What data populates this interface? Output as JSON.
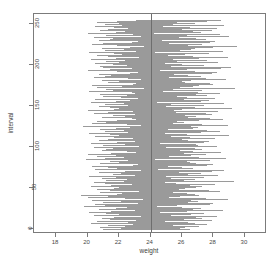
{
  "chart_data": {
    "type": "line",
    "title": "",
    "xlabel": "weight",
    "ylabel": "interval",
    "xlim": [
      16.6,
      31.4
    ],
    "ylim": [
      -6,
      262
    ],
    "grid": false,
    "legend": null,
    "xticks": [
      18,
      20,
      22,
      24,
      26,
      28,
      30
    ],
    "yticks": [
      0,
      50,
      100,
      150,
      200,
      250
    ],
    "series_description": "Horizontal confidence-interval segments, one per simulated interval index (0-255), drawn in light gray; a vertical reference line marks the true mean.",
    "reference_line": {
      "orientation": "vertical",
      "x": 24,
      "color": "#6e6e6e"
    },
    "segment_color": "#9a9a9a",
    "n_intervals": 256,
    "intervals": [
      [
        21.0,
        26.5
      ],
      [
        22.1,
        25.9
      ],
      [
        21.6,
        26.2
      ],
      [
        20.8,
        26.0
      ],
      [
        22.4,
        27.1
      ],
      [
        21.3,
        25.4
      ],
      [
        22.9,
        27.6
      ],
      [
        20.2,
        25.1
      ],
      [
        21.9,
        26.8
      ],
      [
        22.6,
        26.4
      ],
      [
        20.6,
        24.9
      ],
      [
        23.1,
        27.9
      ],
      [
        21.4,
        26.1
      ],
      [
        22.2,
        27.3
      ],
      [
        20.9,
        25.6
      ],
      [
        21.7,
        26.9
      ],
      [
        23.4,
        28.2
      ],
      [
        20.4,
        25.3
      ],
      [
        22.0,
        26.6
      ],
      [
        21.2,
        25.8
      ],
      [
        22.8,
        27.4
      ],
      [
        20.1,
        24.6
      ],
      [
        21.5,
        26.3
      ],
      [
        23.0,
        28.6
      ],
      [
        22.3,
        26.7
      ],
      [
        20.7,
        25.0
      ],
      [
        21.8,
        27.2
      ],
      [
        22.5,
        26.0
      ],
      [
        19.8,
        24.4
      ],
      [
        21.1,
        25.7
      ],
      [
        22.7,
        27.8
      ],
      [
        20.5,
        25.5
      ],
      [
        23.2,
        28.0
      ],
      [
        21.0,
        26.4
      ],
      [
        22.1,
        27.0
      ],
      [
        20.3,
        24.8
      ],
      [
        21.6,
        26.6
      ],
      [
        23.5,
        28.9
      ],
      [
        22.4,
        27.5
      ],
      [
        20.0,
        25.2
      ],
      [
        21.3,
        25.9
      ],
      [
        22.9,
        27.1
      ],
      [
        19.6,
        24.1
      ],
      [
        21.9,
        26.8
      ],
      [
        22.2,
        26.3
      ],
      [
        20.8,
        25.4
      ],
      [
        23.3,
        28.4
      ],
      [
        21.4,
        26.0
      ],
      [
        22.6,
        27.7
      ],
      [
        20.6,
        25.8
      ],
      [
        21.7,
        26.2
      ],
      [
        22.0,
        26.9
      ],
      [
        23.1,
        27.3
      ],
      [
        20.2,
        24.7
      ],
      [
        21.5,
        26.5
      ],
      [
        22.8,
        28.1
      ],
      [
        21.1,
        25.6
      ],
      [
        20.4,
        24.9
      ],
      [
        22.3,
        27.0
      ],
      [
        23.6,
        29.3
      ],
      [
        21.2,
        26.1
      ],
      [
        22.5,
        26.8
      ],
      [
        20.9,
        25.3
      ],
      [
        21.8,
        27.4
      ],
      [
        22.7,
        26.6
      ],
      [
        20.1,
        25.0
      ],
      [
        23.0,
        28.3
      ],
      [
        21.6,
        26.4
      ],
      [
        22.1,
        27.2
      ],
      [
        20.7,
        25.5
      ],
      [
        21.0,
        25.8
      ],
      [
        22.4,
        27.9
      ],
      [
        23.4,
        28.7
      ],
      [
        20.5,
        24.5
      ],
      [
        21.9,
        26.7
      ],
      [
        22.2,
        26.2
      ],
      [
        21.3,
        26.0
      ],
      [
        20.3,
        25.1
      ],
      [
        22.9,
        27.6
      ],
      [
        23.2,
        28.0
      ],
      [
        21.7,
        26.9
      ],
      [
        20.8,
        25.7
      ],
      [
        22.0,
        26.5
      ],
      [
        21.4,
        26.3
      ],
      [
        22.6,
        27.8
      ],
      [
        19.9,
        24.3
      ],
      [
        21.1,
        25.4
      ],
      [
        23.5,
        28.8
      ],
      [
        22.3,
        27.1
      ],
      [
        20.6,
        25.2
      ],
      [
        21.8,
        26.6
      ],
      [
        22.8,
        27.5
      ],
      [
        20.0,
        24.8
      ],
      [
        21.5,
        26.1
      ],
      [
        23.1,
        28.5
      ],
      [
        22.5,
        26.7
      ],
      [
        20.9,
        25.9
      ],
      [
        21.2,
        25.5
      ],
      [
        22.7,
        27.3
      ],
      [
        21.6,
        26.8
      ],
      [
        20.4,
        25.0
      ],
      [
        23.3,
        28.2
      ],
      [
        22.1,
        27.0
      ],
      [
        21.0,
        26.2
      ],
      [
        22.4,
        26.9
      ],
      [
        20.2,
        24.6
      ],
      [
        21.9,
        27.4
      ],
      [
        23.0,
        27.7
      ],
      [
        22.2,
        26.4
      ],
      [
        20.7,
        25.6
      ],
      [
        21.3,
        26.0
      ],
      [
        22.9,
        28.1
      ],
      [
        21.7,
        26.5
      ],
      [
        20.5,
        25.3
      ],
      [
        23.6,
        29.0
      ],
      [
        22.0,
        26.8
      ],
      [
        21.4,
        26.3
      ],
      [
        20.1,
        24.9
      ],
      [
        22.6,
        27.2
      ],
      [
        23.2,
        28.4
      ],
      [
        21.1,
        25.8
      ],
      [
        22.3,
        27.6
      ],
      [
        20.8,
        25.1
      ],
      [
        21.8,
        26.7
      ],
      [
        22.7,
        27.0
      ],
      [
        19.7,
        24.2
      ],
      [
        21.5,
        26.6
      ],
      [
        23.4,
        28.9
      ],
      [
        22.5,
        27.3
      ],
      [
        20.3,
        25.4
      ],
      [
        21.2,
        25.9
      ],
      [
        22.1,
        26.1
      ],
      [
        20.6,
        25.7
      ],
      [
        21.9,
        27.1
      ],
      [
        23.1,
        28.6
      ],
      [
        22.8,
        27.8
      ],
      [
        21.0,
        26.4
      ],
      [
        20.9,
        25.2
      ],
      [
        22.4,
        26.9
      ],
      [
        21.6,
        26.2
      ],
      [
        23.0,
        27.9
      ],
      [
        20.4,
        24.7
      ],
      [
        22.2,
        27.5
      ],
      [
        21.3,
        25.6
      ],
      [
        22.9,
        28.3
      ],
      [
        20.0,
        25.5
      ],
      [
        21.7,
        26.0
      ],
      [
        23.5,
        29.2
      ],
      [
        22.0,
        26.6
      ],
      [
        21.4,
        26.8
      ],
      [
        20.7,
        25.0
      ],
      [
        22.6,
        27.4
      ],
      [
        21.1,
        25.3
      ],
      [
        23.3,
        28.7
      ],
      [
        22.3,
        26.5
      ],
      [
        20.2,
        24.4
      ],
      [
        21.8,
        27.2
      ],
      [
        22.7,
        27.7
      ],
      [
        21.5,
        26.1
      ],
      [
        20.5,
        25.8
      ],
      [
        23.2,
        28.1
      ],
      [
        22.1,
        26.3
      ],
      [
        21.0,
        25.7
      ],
      [
        22.5,
        27.6
      ],
      [
        20.8,
        25.1
      ],
      [
        21.9,
        26.9
      ],
      [
        23.0,
        28.4
      ],
      [
        22.8,
        27.0
      ],
      [
        20.1,
        24.8
      ],
      [
        21.6,
        26.5
      ],
      [
        22.4,
        27.3
      ],
      [
        21.2,
        25.4
      ],
      [
        23.6,
        29.4
      ],
      [
        20.6,
        25.9
      ],
      [
        22.2,
        26.7
      ],
      [
        21.7,
        27.1
      ],
      [
        20.3,
        24.5
      ],
      [
        22.9,
        28.0
      ],
      [
        23.1,
        27.8
      ],
      [
        21.3,
        26.2
      ],
      [
        22.0,
        26.0
      ],
      [
        20.9,
        25.6
      ],
      [
        21.8,
        26.6
      ],
      [
        23.4,
        28.8
      ],
      [
        22.6,
        27.5
      ],
      [
        20.4,
        25.2
      ],
      [
        21.1,
        25.0
      ],
      [
        22.3,
        27.2
      ],
      [
        21.5,
        26.4
      ],
      [
        20.7,
        25.5
      ],
      [
        22.7,
        27.9
      ],
      [
        23.2,
        28.2
      ],
      [
        21.9,
        26.8
      ],
      [
        22.1,
        26.1
      ],
      [
        20.0,
        24.6
      ],
      [
        21.4,
        26.3
      ],
      [
        22.8,
        28.5
      ],
      [
        21.0,
        25.8
      ],
      [
        23.5,
        29.1
      ],
      [
        20.8,
        25.3
      ],
      [
        22.5,
        27.4
      ],
      [
        21.6,
        26.0
      ],
      [
        20.5,
        24.9
      ],
      [
        22.0,
        26.9
      ],
      [
        23.0,
        28.3
      ],
      [
        21.2,
        25.7
      ],
      [
        22.4,
        27.6
      ],
      [
        20.2,
        25.4
      ],
      [
        21.8,
        26.5
      ],
      [
        22.9,
        27.1
      ],
      [
        23.3,
        28.9
      ],
      [
        21.3,
        26.7
      ],
      [
        20.6,
        25.1
      ],
      [
        22.2,
        26.2
      ],
      [
        21.7,
        27.0
      ],
      [
        22.6,
        27.7
      ],
      [
        20.1,
        24.3
      ],
      [
        23.1,
        28.6
      ],
      [
        21.1,
        25.9
      ],
      [
        22.3,
        26.6
      ],
      [
        20.9,
        25.0
      ],
      [
        21.5,
        26.8
      ],
      [
        22.7,
        28.0
      ],
      [
        23.6,
        29.5
      ],
      [
        21.9,
        26.4
      ],
      [
        20.3,
        25.6
      ],
      [
        22.0,
        27.3
      ],
      [
        21.0,
        25.2
      ],
      [
        22.8,
        27.8
      ],
      [
        23.2,
        28.1
      ],
      [
        20.7,
        24.7
      ],
      [
        21.4,
        26.1
      ],
      [
        22.5,
        27.5
      ],
      [
        21.6,
        26.9
      ],
      [
        20.4,
        25.8
      ],
      [
        23.4,
        29.0
      ],
      [
        22.1,
        26.3
      ],
      [
        21.2,
        25.5
      ],
      [
        22.9,
        28.4
      ],
      [
        20.0,
        24.2
      ],
      [
        21.8,
        27.2
      ],
      [
        22.4,
        26.7
      ],
      [
        23.0,
        27.9
      ],
      [
        20.8,
        25.3
      ],
      [
        21.3,
        26.0
      ],
      [
        22.6,
        28.2
      ],
      [
        21.7,
        26.5
      ],
      [
        20.5,
        24.8
      ],
      [
        22.2,
        27.1
      ],
      [
        23.5,
        28.7
      ],
      [
        21.1,
        25.4
      ],
      [
        22.0,
        26.8
      ],
      [
        20.6,
        25.7
      ],
      [
        21.9,
        27.6
      ],
      [
        22.7,
        26.2
      ],
      [
        23.1,
        28.5
      ]
    ]
  }
}
